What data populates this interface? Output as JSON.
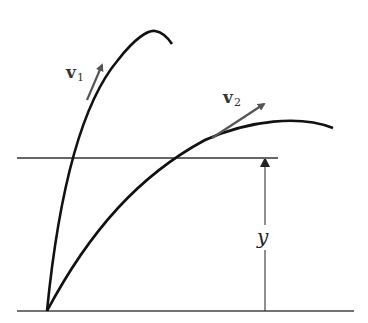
{
  "diagram": {
    "labels": {
      "v1": {
        "main": "v",
        "sub": "1"
      },
      "v2": {
        "main": "v",
        "sub": "2"
      },
      "height": "y"
    },
    "colors": {
      "curve": "#111111",
      "arrow": "#555555",
      "line": "#333333",
      "background": "#ffffff"
    }
  }
}
